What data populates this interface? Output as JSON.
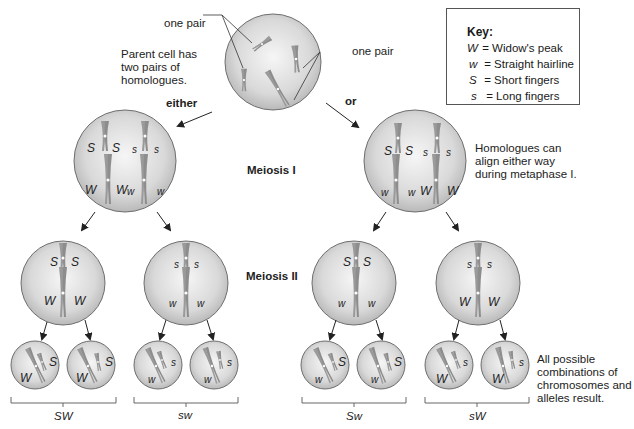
{
  "key": {
    "title": "Key:",
    "entries": [
      {
        "symbol": "W",
        "meaning": "= Widow's peak"
      },
      {
        "symbol": "w",
        "meaning": "= Straight hairline"
      },
      {
        "symbol": "S",
        "meaning": "= Short fingers"
      },
      {
        "symbol": "s",
        "meaning": "= Long fingers"
      }
    ]
  },
  "parent": {
    "description": "Parent cell has two pairs of homologues.",
    "description_lines": [
      "Parent cell has",
      "two pairs of",
      "homologues."
    ],
    "pair_label_left": "one pair",
    "pair_label_right": "one pair"
  },
  "branches": {
    "left_label": "either",
    "right_label": "or"
  },
  "stages": {
    "meiosis1": "Meiosis I",
    "meiosis2": "Meiosis II"
  },
  "notes": {
    "homologues_align": [
      "Homologues can",
      "align either way",
      "during metaphase I."
    ],
    "all_combinations": [
      "All possible",
      "combinations of",
      "chromosomes and",
      "alleles result."
    ]
  },
  "meiosis1_cells": {
    "left": {
      "top_left": "S",
      "top_mid1": "S",
      "top_mid2": "s",
      "top_right": "s",
      "bot_left": "W",
      "bot_mid1": "W",
      "bot_mid2": "w",
      "bot_right": "w"
    },
    "right": {
      "top_left": "S",
      "top_mid1": "S",
      "top_mid2": "s",
      "top_right": "s",
      "bot_left": "w",
      "bot_mid1": "w",
      "bot_mid2": "W",
      "bot_right": "W"
    }
  },
  "meiosis2_cells": [
    {
      "top": [
        "S",
        "S"
      ],
      "bottom": [
        "W",
        "W"
      ]
    },
    {
      "top": [
        "s",
        "s"
      ],
      "bottom": [
        "w",
        "w"
      ]
    },
    {
      "top": [
        "S",
        "S"
      ],
      "bottom": [
        "w",
        "w"
      ]
    },
    {
      "top": [
        "s",
        "s"
      ],
      "bottom": [
        "W",
        "W"
      ]
    }
  ],
  "gametes": [
    {
      "a1": "S",
      "a2": "W"
    },
    {
      "a1": "S",
      "a2": "W"
    },
    {
      "a1": "s",
      "a2": "w"
    },
    {
      "a1": "s",
      "a2": "w"
    },
    {
      "a1": "S",
      "a2": "w"
    },
    {
      "a1": "S",
      "a2": "w"
    },
    {
      "a1": "s",
      "a2": "W"
    },
    {
      "a1": "s",
      "a2": "W"
    }
  ],
  "gamete_groups": [
    "SW",
    "sw",
    "Sw",
    "sW"
  ],
  "colors": {
    "cell_fill_center": "#f4f4f4",
    "cell_fill_edge": "#bdbdbd",
    "cell_outline": "#6e6e6e",
    "chromosome": "#9a9a9a",
    "chromosome_dark": "#7a7a7a",
    "arrow": "#222222"
  }
}
